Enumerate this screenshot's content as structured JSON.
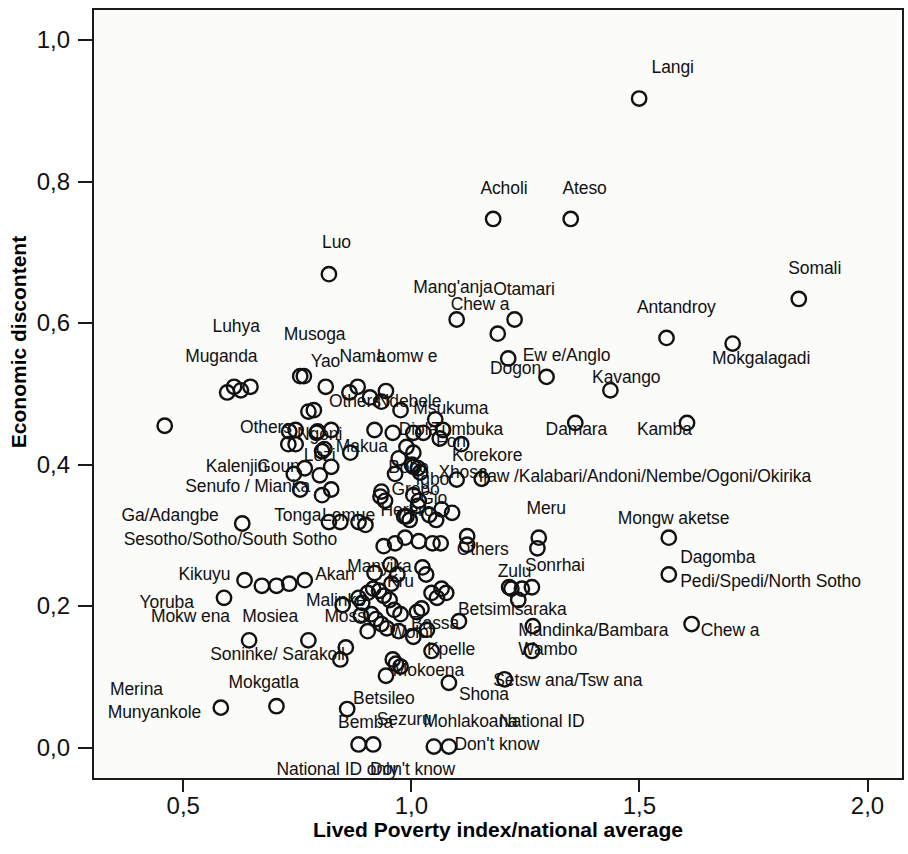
{
  "chart_data": {
    "type": "scatter",
    "title": "",
    "xlabel": "Lived Poverty index/national average",
    "ylabel": "Economic discontent",
    "xlim": [
      0.3,
      2.08
    ],
    "ylim": [
      -0.045,
      1.045
    ],
    "xticks": [
      "0,5",
      "1,0",
      "1,5",
      "2,0"
    ],
    "xtick_values": [
      0.5,
      1.0,
      1.5,
      2.0
    ],
    "yticks": [
      "0,0",
      "0,2",
      "0,4",
      "0,6",
      "0,8",
      "1,0"
    ],
    "ytick_values": [
      0.0,
      0.2,
      0.4,
      0.6,
      0.8,
      1.0
    ],
    "grid": false,
    "legend": "none",
    "marker": "open-circle",
    "decimal_separator": "comma",
    "points": [
      {
        "label": "Langi",
        "x": 1.495,
        "y": 0.92,
        "lx": 1.522,
        "ly": 0.963,
        "anchor": "start"
      },
      {
        "label": "Acholi",
        "x": 1.175,
        "y": 0.75,
        "lx": 1.147,
        "ly": 0.792,
        "anchor": "start"
      },
      {
        "label": "Ateso",
        "x": 1.345,
        "y": 0.75,
        "lx": 1.327,
        "ly": 0.792,
        "anchor": "start"
      },
      {
        "label": "Luo",
        "x": 0.815,
        "y": 0.672,
        "lx": 0.8,
        "ly": 0.716,
        "anchor": "start"
      },
      {
        "label": "Somali",
        "x": 1.845,
        "y": 0.637,
        "lx": 1.822,
        "ly": 0.68,
        "anchor": "start"
      },
      {
        "label": "Mang'anja",
        "x": 1.095,
        "y": 0.608,
        "lx": 1.0,
        "ly": 0.652,
        "anchor": "start"
      },
      {
        "label": "Otamari",
        "x": 1.222,
        "y": 0.608,
        "lx": 1.175,
        "ly": 0.65,
        "anchor": "start"
      },
      {
        "label": "Chew a",
        "x": 1.185,
        "y": 0.588,
        "lx": 1.082,
        "ly": 0.628,
        "anchor": "start"
      },
      {
        "label": "Antandroy",
        "x": 1.555,
        "y": 0.582,
        "lx": 1.49,
        "ly": 0.624,
        "anchor": "start"
      },
      {
        "label": "Mokgalagadi",
        "x": 1.7,
        "y": 0.574,
        "lx": 1.655,
        "ly": 0.552,
        "anchor": "start"
      },
      {
        "label": "Luhya",
        "x": 0.643,
        "y": 0.513,
        "lx": 0.56,
        "ly": 0.598,
        "anchor": "start"
      },
      {
        "label": "Musoga",
        "x": 0.76,
        "y": 0.528,
        "lx": 0.716,
        "ly": 0.586,
        "anchor": "start"
      },
      {
        "label": "Muganda",
        "x": 0.607,
        "y": 0.513,
        "lx": 0.5,
        "ly": 0.555,
        "anchor": "start"
      },
      {
        "label": "Yao",
        "x": 0.808,
        "y": 0.513,
        "lx": 0.775,
        "ly": 0.548,
        "anchor": "start"
      },
      {
        "label": "Nama",
        "x": 0.878,
        "y": 0.513,
        "lx": 0.838,
        "ly": 0.555,
        "anchor": "start"
      },
      {
        "label": "Lomw e",
        "x": 0.94,
        "y": 0.507,
        "lx": 0.92,
        "ly": 0.555,
        "anchor": "start"
      },
      {
        "label": "Ew e/Anglo",
        "x": 1.292,
        "y": 0.527,
        "lx": 1.24,
        "ly": 0.556,
        "anchor": "start"
      },
      {
        "label": "Dogon",
        "x": 1.208,
        "y": 0.553,
        "lx": 1.168,
        "ly": 0.538,
        "anchor": "start"
      },
      {
        "label": "Kavango",
        "x": 1.432,
        "y": 0.508,
        "lx": 1.392,
        "ly": 0.526,
        "anchor": "start"
      },
      {
        "label": "Others",
        "x": 0.782,
        "y": 0.48,
        "lx": 0.815,
        "ly": 0.492,
        "anchor": "start"
      },
      {
        "label": "Ndebele",
        "x": 0.972,
        "y": 0.48,
        "lx": 0.92,
        "ly": 0.492,
        "anchor": "start"
      },
      {
        "label": "Msukuma",
        "x": 1.048,
        "y": 0.467,
        "lx": 1.0,
        "ly": 0.482,
        "anchor": "start"
      },
      {
        "label": "Tumbuka",
        "x": 1.065,
        "y": 0.452,
        "lx": 1.04,
        "ly": 0.452,
        "anchor": "start"
      },
      {
        "label": "Damara",
        "x": 1.355,
        "y": 0.462,
        "lx": 1.29,
        "ly": 0.452,
        "anchor": "start"
      },
      {
        "label": "Kamba",
        "x": 1.6,
        "y": 0.462,
        "lx": 1.49,
        "ly": 0.452,
        "anchor": "start"
      },
      {
        "label": "Others",
        "x": 0.728,
        "y": 0.45,
        "lx": 0.62,
        "ly": 0.455,
        "anchor": "start"
      },
      {
        "label": "Ngoni",
        "x": 0.79,
        "y": 0.45,
        "lx": 0.745,
        "ly": 0.445,
        "anchor": "start"
      },
      {
        "label": "Diola",
        "x": 1.0,
        "y": 0.448,
        "lx": 0.968,
        "ly": 0.452,
        "anchor": "start"
      },
      {
        "label": "Fon",
        "x": 1.058,
        "y": 0.44,
        "lx": 1.05,
        "ly": 0.435,
        "anchor": "start"
      },
      {
        "label": "Korekore",
        "x": 1.105,
        "y": 0.432,
        "lx": 1.085,
        "ly": 0.415,
        "anchor": "start"
      },
      {
        "label": "Makua",
        "x": 0.862,
        "y": 0.42,
        "lx": 0.83,
        "ly": 0.428,
        "anchor": "start"
      },
      {
        "label": "Lozi",
        "x": 0.8,
        "y": 0.422,
        "lx": 0.76,
        "ly": 0.415,
        "anchor": "start"
      },
      {
        "label": "Kalenjin",
        "x": 0.738,
        "y": 0.39,
        "lx": 0.545,
        "ly": 0.4,
        "anchor": "start"
      },
      {
        "label": "Goun",
        "x": 0.795,
        "y": 0.388,
        "lx": 0.658,
        "ly": 0.4,
        "anchor": "start"
      },
      {
        "label": "Bobo",
        "x": 1.0,
        "y": 0.4,
        "lx": 0.945,
        "ly": 0.398,
        "anchor": "start"
      },
      {
        "label": "Igbo",
        "x": 1.015,
        "y": 0.392,
        "lx": 1.005,
        "ly": 0.382,
        "anchor": "start"
      },
      {
        "label": "Xhosa",
        "x": 1.095,
        "y": 0.382,
        "lx": 1.055,
        "ly": 0.392,
        "anchor": "start"
      },
      {
        "label": "Ijaw /Kalabari/Andoni/Nembe/Ogoni/Okirika",
        "x": 1.15,
        "y": 0.383,
        "lx": 1.143,
        "ly": 0.385,
        "anchor": "start"
      },
      {
        "label": "Senufo / Mianka",
        "x": 0.8,
        "y": 0.36,
        "lx": 0.5,
        "ly": 0.372,
        "anchor": "start"
      },
      {
        "label": "Grebo",
        "x": 0.928,
        "y": 0.358,
        "lx": 0.952,
        "ly": 0.368,
        "anchor": "start"
      },
      {
        "label": "Gio",
        "x": 1.01,
        "y": 0.345,
        "lx": 1.015,
        "ly": 0.355,
        "anchor": "start"
      },
      {
        "label": "Herero",
        "x": 0.985,
        "y": 0.33,
        "lx": 0.928,
        "ly": 0.338,
        "anchor": "start"
      },
      {
        "label": "Meru",
        "x": 1.275,
        "y": 0.3,
        "lx": 1.248,
        "ly": 0.34,
        "anchor": "start"
      },
      {
        "label": "Mongw aketse",
        "x": 1.56,
        "y": 0.3,
        "lx": 1.448,
        "ly": 0.327,
        "anchor": "start"
      },
      {
        "label": "Ga/Adangbe",
        "x": 0.625,
        "y": 0.32,
        "lx": 0.36,
        "ly": 0.33,
        "anchor": "start"
      },
      {
        "label": "Tonga",
        "x": 0.84,
        "y": 0.322,
        "lx": 0.695,
        "ly": 0.33,
        "anchor": "start"
      },
      {
        "label": "Lomue",
        "x": 0.88,
        "y": 0.322,
        "lx": 0.8,
        "ly": 0.33,
        "anchor": "start"
      },
      {
        "label": "Sesotho/Sotho/South Sotho",
        "x": 0.935,
        "y": 0.288,
        "lx": 0.365,
        "ly": 0.297,
        "anchor": "start"
      },
      {
        "label": "Others",
        "x": 1.118,
        "y": 0.29,
        "lx": 1.095,
        "ly": 0.282,
        "anchor": "start"
      },
      {
        "label": "Kikuyu",
        "x": 0.63,
        "y": 0.24,
        "lx": 0.485,
        "ly": 0.248,
        "anchor": "start"
      },
      {
        "label": "Akan",
        "x": 0.762,
        "y": 0.24,
        "lx": 0.785,
        "ly": 0.248,
        "anchor": "start"
      },
      {
        "label": "Manyika",
        "x": 0.915,
        "y": 0.25,
        "lx": 0.855,
        "ly": 0.258,
        "anchor": "start"
      },
      {
        "label": "Kru",
        "x": 0.952,
        "y": 0.235,
        "lx": 0.942,
        "ly": 0.238,
        "anchor": "start"
      },
      {
        "label": "Zulu",
        "x": 1.21,
        "y": 0.23,
        "lx": 1.185,
        "ly": 0.252,
        "anchor": "start"
      },
      {
        "label": "Sonrhai",
        "x": 1.26,
        "y": 0.23,
        "lx": 1.245,
        "ly": 0.26,
        "anchor": "start"
      },
      {
        "label": "Dagomba",
        "x": 1.56,
        "y": 0.248,
        "lx": 1.585,
        "ly": 0.272,
        "anchor": "start"
      },
      {
        "label": "Pedi/Spedi/North Sotho",
        "x": 1.56,
        "y": 0.248,
        "lx": 1.585,
        "ly": 0.238,
        "anchor": "start"
      },
      {
        "label": "Yoruba",
        "x": 0.585,
        "y": 0.215,
        "lx": 0.4,
        "ly": 0.208,
        "anchor": "start"
      },
      {
        "label": "Malinke",
        "x": 0.845,
        "y": 0.205,
        "lx": 0.765,
        "ly": 0.21,
        "anchor": "start"
      },
      {
        "label": "Mossi",
        "x": 0.885,
        "y": 0.19,
        "lx": 0.805,
        "ly": 0.188,
        "anchor": "start"
      },
      {
        "label": "Bassa",
        "x": 1.03,
        "y": 0.17,
        "lx": 0.995,
        "ly": 0.178,
        "anchor": "start"
      },
      {
        "label": "Betsimisaraka",
        "x": 1.1,
        "y": 0.182,
        "lx": 1.098,
        "ly": 0.198,
        "anchor": "start"
      },
      {
        "label": "Mandinka/Bambara",
        "x": 1.262,
        "y": 0.175,
        "lx": 1.23,
        "ly": 0.168,
        "anchor": "start"
      },
      {
        "label": "Chew a",
        "x": 1.61,
        "y": 0.178,
        "lx": 1.63,
        "ly": 0.168,
        "anchor": "start"
      },
      {
        "label": "Mokw ena",
        "x": 0.64,
        "y": 0.155,
        "lx": 0.425,
        "ly": 0.188,
        "anchor": "start"
      },
      {
        "label": "Mosiea",
        "x": 0.77,
        "y": 0.155,
        "lx": 0.625,
        "ly": 0.188,
        "anchor": "start"
      },
      {
        "label": "Wolof",
        "x": 1.0,
        "y": 0.16,
        "lx": 0.948,
        "ly": 0.165,
        "anchor": "start"
      },
      {
        "label": "Kpelle",
        "x": 1.04,
        "y": 0.14,
        "lx": 1.03,
        "ly": 0.142,
        "anchor": "start"
      },
      {
        "label": "Wambo",
        "x": 1.26,
        "y": 0.14,
        "lx": 1.23,
        "ly": 0.142,
        "anchor": "start"
      },
      {
        "label": "Soninke/ Sarakoll",
        "x": 0.84,
        "y": 0.128,
        "lx": 0.555,
        "ly": 0.135,
        "anchor": "start"
      },
      {
        "label": "Mokoena",
        "x": 0.94,
        "y": 0.105,
        "lx": 0.955,
        "ly": 0.112,
        "anchor": "start"
      },
      {
        "label": "Merina",
        "x": 0.578,
        "y": 0.06,
        "lx": 0.335,
        "ly": 0.085,
        "anchor": "start"
      },
      {
        "label": "Mokgatla",
        "x": 0.7,
        "y": 0.062,
        "lx": 0.595,
        "ly": 0.095,
        "anchor": "start"
      },
      {
        "label": "Betsileo",
        "x": 0.855,
        "y": 0.058,
        "lx": 0.868,
        "ly": 0.072,
        "anchor": "start"
      },
      {
        "label": "Munyankole",
        "x": 0.578,
        "y": 0.06,
        "lx": 0.33,
        "ly": 0.052,
        "anchor": "start"
      },
      {
        "label": "Shona",
        "x": 1.078,
        "y": 0.095,
        "lx": 1.1,
        "ly": 0.078,
        "anchor": "start"
      },
      {
        "label": "Setsw ana/Tsw ana",
        "x": 1.2,
        "y": 0.1,
        "lx": 1.175,
        "ly": 0.098,
        "anchor": "start"
      },
      {
        "label": "Bemba",
        "x": 0.88,
        "y": 0.008,
        "lx": 0.835,
        "ly": 0.038,
        "anchor": "start"
      },
      {
        "label": "Sezuru",
        "x": 0.912,
        "y": 0.008,
        "lx": 0.92,
        "ly": 0.042,
        "anchor": "start"
      },
      {
        "label": "Mohlakoana",
        "x": 1.045,
        "y": 0.005,
        "lx": 1.022,
        "ly": 0.04,
        "anchor": "start"
      },
      {
        "label": "National ID",
        "x": 1.078,
        "y": 0.005,
        "lx": 1.188,
        "ly": 0.04,
        "anchor": "start"
      },
      {
        "label": "National ID only",
        "x": 0.88,
        "y": 0.008,
        "lx": 0.7,
        "ly": -0.028,
        "anchor": "start"
      },
      {
        "label": "Don't know",
        "x": 0.912,
        "y": 0.008,
        "lx": 0.905,
        "ly": -0.028,
        "anchor": "start"
      },
      {
        "label": "Don't know",
        "x": 1.078,
        "y": 0.005,
        "lx": 1.09,
        "ly": 0.008,
        "anchor": "start"
      }
    ],
    "markers_unlabeled": [
      {
        "x": 0.455,
        "y": 0.458
      },
      {
        "x": 0.592,
        "y": 0.505
      },
      {
        "x": 0.622,
        "y": 0.508
      },
      {
        "x": 0.752,
        "y": 0.528
      },
      {
        "x": 0.86,
        "y": 0.505
      },
      {
        "x": 0.905,
        "y": 0.498
      },
      {
        "x": 0.93,
        "y": 0.492
      },
      {
        "x": 0.77,
        "y": 0.478
      },
      {
        "x": 0.742,
        "y": 0.452
      },
      {
        "x": 0.788,
        "y": 0.448
      },
      {
        "x": 0.82,
        "y": 0.452
      },
      {
        "x": 0.915,
        "y": 0.452
      },
      {
        "x": 0.955,
        "y": 0.448
      },
      {
        "x": 1.022,
        "y": 0.448
      },
      {
        "x": 0.726,
        "y": 0.432
      },
      {
        "x": 0.742,
        "y": 0.432
      },
      {
        "x": 0.805,
        "y": 0.425
      },
      {
        "x": 0.985,
        "y": 0.428
      },
      {
        "x": 1.0,
        "y": 0.42
      },
      {
        "x": 0.762,
        "y": 0.398
      },
      {
        "x": 0.82,
        "y": 0.4
      },
      {
        "x": 0.997,
        "y": 0.403
      },
      {
        "x": 1.01,
        "y": 0.398
      },
      {
        "x": 0.968,
        "y": 0.412
      },
      {
        "x": 0.96,
        "y": 0.39
      },
      {
        "x": 0.752,
        "y": 0.368
      },
      {
        "x": 0.82,
        "y": 0.368
      },
      {
        "x": 0.93,
        "y": 0.365
      },
      {
        "x": 0.938,
        "y": 0.352
      },
      {
        "x": 1.0,
        "y": 0.36
      },
      {
        "x": 1.012,
        "y": 0.352
      },
      {
        "x": 0.815,
        "y": 0.322
      },
      {
        "x": 0.895,
        "y": 0.318
      },
      {
        "x": 0.98,
        "y": 0.33
      },
      {
        "x": 0.992,
        "y": 0.325
      },
      {
        "x": 1.035,
        "y": 0.332
      },
      {
        "x": 1.05,
        "y": 0.325
      },
      {
        "x": 1.062,
        "y": 0.34
      },
      {
        "x": 1.085,
        "y": 0.335
      },
      {
        "x": 0.96,
        "y": 0.292
      },
      {
        "x": 0.982,
        "y": 0.3
      },
      {
        "x": 1.012,
        "y": 0.295
      },
      {
        "x": 1.042,
        "y": 0.292
      },
      {
        "x": 1.06,
        "y": 0.292
      },
      {
        "x": 1.118,
        "y": 0.302
      },
      {
        "x": 1.272,
        "y": 0.285
      },
      {
        "x": 0.668,
        "y": 0.232
      },
      {
        "x": 0.7,
        "y": 0.232
      },
      {
        "x": 0.728,
        "y": 0.235
      },
      {
        "x": 0.95,
        "y": 0.262
      },
      {
        "x": 0.965,
        "y": 0.248
      },
      {
        "x": 1.02,
        "y": 0.258
      },
      {
        "x": 1.028,
        "y": 0.248
      },
      {
        "x": 0.9,
        "y": 0.222
      },
      {
        "x": 0.912,
        "y": 0.228
      },
      {
        "x": 0.925,
        "y": 0.225
      },
      {
        "x": 0.935,
        "y": 0.218
      },
      {
        "x": 0.948,
        "y": 0.212
      },
      {
        "x": 0.88,
        "y": 0.215
      },
      {
        "x": 0.888,
        "y": 0.208
      },
      {
        "x": 1.04,
        "y": 0.222
      },
      {
        "x": 1.052,
        "y": 0.215
      },
      {
        "x": 1.062,
        "y": 0.228
      },
      {
        "x": 1.072,
        "y": 0.222
      },
      {
        "x": 0.958,
        "y": 0.198
      },
      {
        "x": 0.972,
        "y": 0.192
      },
      {
        "x": 0.908,
        "y": 0.192
      },
      {
        "x": 0.918,
        "y": 0.185
      },
      {
        "x": 0.93,
        "y": 0.178
      },
      {
        "x": 0.942,
        "y": 0.172
      },
      {
        "x": 0.9,
        "y": 0.168
      },
      {
        "x": 0.968,
        "y": 0.168
      },
      {
        "x": 1.008,
        "y": 0.195
      },
      {
        "x": 1.018,
        "y": 0.2
      },
      {
        "x": 0.852,
        "y": 0.145
      },
      {
        "x": 0.955,
        "y": 0.128
      },
      {
        "x": 0.962,
        "y": 0.122
      },
      {
        "x": 0.972,
        "y": 0.118
      },
      {
        "x": 1.215,
        "y": 0.228
      },
      {
        "x": 1.238,
        "y": 0.228
      },
      {
        "x": 1.23,
        "y": 0.212
      }
    ]
  },
  "axes": {
    "x_label": "Lived Poverty index/national average",
    "y_label": "Economic discontent",
    "x_tick_labels": [
      "0,5",
      "1,0",
      "1,5",
      "2,0"
    ],
    "y_tick_labels": [
      "1,0",
      "0,8",
      "0,6",
      "0,4",
      "0,2",
      "0,0"
    ]
  },
  "colors": {
    "axis": "#1a1a1a",
    "marker_stroke": "#111111",
    "plot_background": "#fbfbfa",
    "page_background": "#ffffff"
  }
}
